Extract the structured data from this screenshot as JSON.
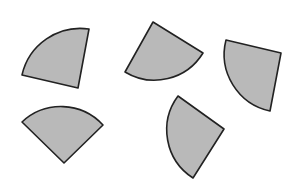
{
  "diagram": {
    "style": {
      "fill": "#b9b9b9",
      "stroke": "#222222",
      "stroke_width": 1.6,
      "background": "#ffffff"
    },
    "shapes": [
      {
        "id": "sector-1",
        "center": [
          78,
          88
        ],
        "p1": [
          22,
          75
        ],
        "p2": [
          89,
          29
        ],
        "radius": 60,
        "sweep": 1
      },
      {
        "id": "sector-2",
        "center": [
          153,
          22
        ],
        "p1": [
          203,
          53
        ],
        "p2": [
          125,
          72
        ],
        "radius": 57,
        "sweep": 1
      },
      {
        "id": "sector-3",
        "center": [
          281,
          53
        ],
        "p1": [
          226,
          40
        ],
        "p2": [
          270,
          111
        ],
        "radius": 58,
        "sweep": 0
      },
      {
        "id": "sector-4",
        "center": [
          64,
          163
        ],
        "p1": [
          22,
          122
        ],
        "p2": [
          103,
          125
        ],
        "radius": 57,
        "sweep": 1
      },
      {
        "id": "sector-5",
        "center": [
          224,
          129
        ],
        "p1": [
          178,
          96
        ],
        "p2": [
          193,
          178
        ],
        "radius": 57,
        "sweep": 0
      }
    ]
  }
}
